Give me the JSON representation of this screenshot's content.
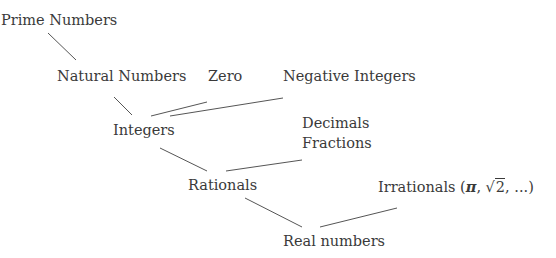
{
  "diagram": {
    "type": "number-set-hierarchy",
    "nodes": {
      "prime": {
        "label": "Prime Numbers"
      },
      "natural": {
        "label": "Natural Numbers"
      },
      "zero": {
        "label": "Zero"
      },
      "negative": {
        "label": "Negative Integers"
      },
      "integers": {
        "label": "Integers"
      },
      "decimals_fractions": {
        "lines": [
          "Decimals",
          "Fractions"
        ]
      },
      "rationals": {
        "label": "Rationals"
      },
      "irrationals": {
        "label_prefix": "Irrationals (",
        "pi": "π",
        "sep1": ", ",
        "sqrt_radicand": "2",
        "suffix": ", ...)"
      },
      "real": {
        "label": "Real numbers"
      }
    },
    "edges": [
      {
        "from": "prime",
        "to": "natural"
      },
      {
        "from": "natural",
        "to": "integers"
      },
      {
        "from": "zero",
        "to": "integers"
      },
      {
        "from": "negative",
        "to": "integers"
      },
      {
        "from": "integers",
        "to": "rationals"
      },
      {
        "from": "decimals_fractions",
        "to": "rationals"
      },
      {
        "from": "rationals",
        "to": "real"
      },
      {
        "from": "irrationals",
        "to": "real"
      }
    ],
    "colors": {
      "text": "#3a3a3a",
      "line": "#555555",
      "background": "#ffffff"
    }
  }
}
